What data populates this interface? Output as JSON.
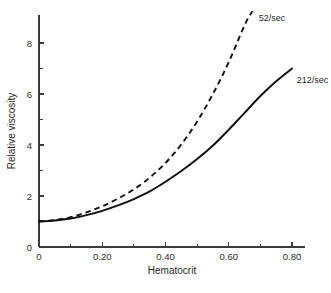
{
  "chart_data": {
    "type": "line",
    "title": "",
    "subtitle": "",
    "xlabel": "Hematocrit",
    "ylabel": "Relative viscosity",
    "xlim": [
      0,
      0.86
    ],
    "ylim": [
      0,
      9.4
    ],
    "grid": false,
    "legend_position": "inline-right-of-curve",
    "x_ticks": [
      {
        "value": 0,
        "label": "0"
      },
      {
        "value": 0.1,
        "label": ""
      },
      {
        "value": 0.2,
        "label": "0.20"
      },
      {
        "value": 0.3,
        "label": ""
      },
      {
        "value": 0.4,
        "label": "0.40"
      },
      {
        "value": 0.5,
        "label": ""
      },
      {
        "value": 0.6,
        "label": "0.60"
      },
      {
        "value": 0.7,
        "label": ""
      },
      {
        "value": 0.8,
        "label": "0.80"
      }
    ],
    "y_ticks": [
      {
        "value": 0,
        "label": "0"
      },
      {
        "value": 1,
        "label": ""
      },
      {
        "value": 2,
        "label": "2"
      },
      {
        "value": 3,
        "label": ""
      },
      {
        "value": 4,
        "label": "4"
      },
      {
        "value": 5,
        "label": ""
      },
      {
        "value": 6,
        "label": "6"
      },
      {
        "value": 7,
        "label": ""
      },
      {
        "value": 8,
        "label": "8"
      }
    ],
    "series": [
      {
        "name": "52/sec",
        "label": "52/sec",
        "style": "dashed",
        "color": "#0d0d0d",
        "x": [
          0.0,
          0.05,
          0.1,
          0.15,
          0.2,
          0.25,
          0.3,
          0.35,
          0.4,
          0.45,
          0.5,
          0.55,
          0.6,
          0.65,
          0.675
        ],
        "values": [
          1.0,
          1.06,
          1.17,
          1.36,
          1.6,
          1.9,
          2.26,
          2.72,
          3.3,
          4.02,
          4.92,
          6.0,
          7.25,
          8.7,
          9.25
        ]
      },
      {
        "name": "212/sec",
        "label": "212/sec",
        "style": "solid",
        "color": "#0d0d0d",
        "x": [
          0.0,
          0.05,
          0.1,
          0.15,
          0.2,
          0.25,
          0.3,
          0.35,
          0.4,
          0.45,
          0.5,
          0.55,
          0.6,
          0.65,
          0.7,
          0.75,
          0.8
        ],
        "values": [
          1.0,
          1.04,
          1.12,
          1.25,
          1.42,
          1.63,
          1.88,
          2.18,
          2.56,
          2.98,
          3.45,
          3.98,
          4.6,
          5.26,
          5.92,
          6.5,
          7.0
        ]
      }
    ],
    "annotations": [
      {
        "text": "52/sec",
        "x": 0.695,
        "y": 8.85
      },
      {
        "text": "212/sec",
        "x": 0.815,
        "y": 6.45
      }
    ]
  }
}
